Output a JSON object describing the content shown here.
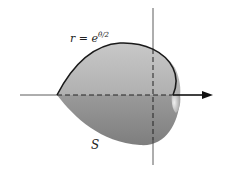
{
  "figure": {
    "curve_label": {
      "lhs": "r = e",
      "exponent": "θ/2"
    },
    "surface_label": "S",
    "colors": {
      "surface_light": "#d2d2d2",
      "surface_dark": "#8a8a8a",
      "curve": "#1a1a1a",
      "axis": "#333333"
    }
  }
}
